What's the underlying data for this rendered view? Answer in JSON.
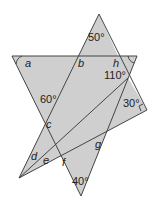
{
  "diagram": {
    "type": "geometry-angles",
    "fill_color": "#cfcfcf",
    "stroke_color": "#444444",
    "labels": {
      "a": "a",
      "b": "b",
      "c": "c",
      "d": "d",
      "e": "e",
      "f": "f",
      "g": "g",
      "h": "h",
      "top_angle": "50°",
      "left_angle": "60°",
      "right_angle_110": "110°",
      "right_angle_30": "30°",
      "bottom_angle": "40°"
    }
  }
}
